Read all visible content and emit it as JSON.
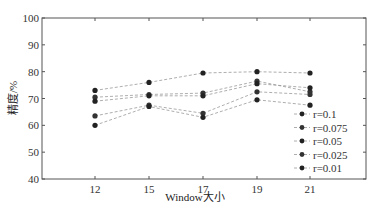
{
  "chart_data": {
    "type": "line",
    "title": "",
    "xlabel": "Window大小",
    "ylabel": "精度/%",
    "categories": [
      "12",
      "15",
      "17",
      "19",
      "21"
    ],
    "ylim": [
      40,
      100
    ],
    "yticks": [
      "40",
      "50",
      "60",
      "70",
      "80",
      "90",
      "100"
    ],
    "grid": false,
    "legend_position": "lower right",
    "series": [
      {
        "name": "r=0.1",
        "values": [
          73,
          76,
          79.5,
          80,
          79.5
        ],
        "color": "#222222"
      },
      {
        "name": "r=0.075",
        "values": [
          70.5,
          71.5,
          72,
          76.5,
          72.5
        ],
        "color": "#333333"
      },
      {
        "name": "r=0.05",
        "values": [
          69,
          71,
          71,
          75.5,
          74
        ],
        "color": "#222222"
      },
      {
        "name": "r=0.025",
        "values": [
          63.5,
          67.5,
          64.5,
          72.5,
          71.5
        ],
        "color": "#333333"
      },
      {
        "name": "r=0.01",
        "values": [
          60,
          67,
          63,
          69.5,
          67.5
        ],
        "color": "#222222"
      }
    ]
  }
}
